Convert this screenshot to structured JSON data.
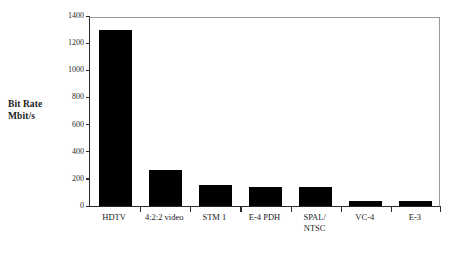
{
  "chart_data": {
    "type": "bar",
    "title": "",
    "xlabel": "",
    "ylabel": "Bit Rate\nMbit/s",
    "ylabel_line1": "Bit Rate",
    "ylabel_line2": "Mbit/s",
    "ylim": [
      0,
      1400
    ],
    "ytick_values": [
      0,
      200,
      400,
      600,
      800,
      1000,
      1200,
      1400
    ],
    "ytick_labels": [
      "0",
      "200",
      "400",
      "600",
      "800",
      "1000",
      "1200",
      "1400"
    ],
    "grid": false,
    "legend": null,
    "bar_color": "#000000",
    "categories": [
      "HDTV",
      "4:2:2 video",
      "STM 1",
      "E-4 PDH",
      "SPAL/\nNTSC",
      "VC-4",
      "E-3"
    ],
    "values": [
      1300,
      265,
      155,
      140,
      140,
      40,
      34
    ]
  },
  "axes": {
    "frame_color": "#9a9a9a",
    "axis_color": "#2b2b2b"
  }
}
